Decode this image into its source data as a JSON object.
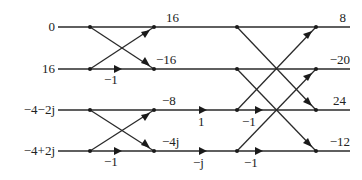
{
  "diagram": {
    "type": "radix-2 FFT butterfly signal-flow graph",
    "inputs": [
      "0",
      "16",
      "−4−2j",
      "−4+2j"
    ],
    "stage1_outputs": [
      "16",
      "−16",
      "−8",
      "−4j"
    ],
    "stage1_weights": [
      "−1",
      "−1"
    ],
    "twiddles": [
      "1",
      "−j"
    ],
    "stage2_weights": [
      "−1",
      "−1"
    ],
    "outputs": [
      "8",
      "−20",
      "24",
      "−12"
    ]
  }
}
